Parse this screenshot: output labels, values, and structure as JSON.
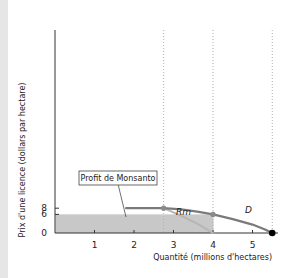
{
  "chart_data": {
    "type": "line",
    "title": "",
    "xlabel": "Quantité (millions d'hectares)",
    "ylabel": "Prix d'une licence (dollars par hectare)",
    "xlim": [
      0,
      5.6
    ],
    "ylim": [
      0,
      25
    ],
    "x_ticks": [
      1,
      2,
      3,
      4,
      5
    ],
    "x_tick_labels": [
      "1",
      "2",
      "3",
      "4",
      "5"
    ],
    "y_ticks": [
      0,
      6,
      8
    ],
    "y_tick_labels": [
      "0",
      "6",
      "8"
    ],
    "grid": false,
    "series": [
      {
        "name": "D",
        "label": "D",
        "color": "#7a7a7a",
        "points": [
          [
            1.8,
            8
          ],
          [
            2.75,
            8
          ],
          [
            3.2,
            7.6
          ],
          [
            3.6,
            6.9
          ],
          [
            4.0,
            6.0
          ],
          [
            4.5,
            4.5
          ],
          [
            5.0,
            2.7
          ],
          [
            5.3,
            1.2
          ],
          [
            5.5,
            0
          ]
        ]
      },
      {
        "name": "Rm",
        "label": "Rm",
        "color": "#b5b5b5",
        "points": [
          [
            2.75,
            8
          ],
          [
            3.2,
            5.5
          ],
          [
            3.6,
            3.0
          ],
          [
            4.0,
            0
          ]
        ]
      }
    ],
    "shaded_region": {
      "label": "Profit de Monsanto",
      "x": [
        0,
        4
      ],
      "y": [
        0,
        6
      ],
      "color": "#c8c8c8"
    },
    "reference_lines_x": [
      2.75,
      4,
      5.5
    ],
    "reference_line_y8": [
      1.8,
      2.75
    ],
    "markers": [
      {
        "x": 2.75,
        "y": 8,
        "color": "#8a8a8a"
      },
      {
        "x": 4,
        "y": 6,
        "color": "#8a8a8a"
      },
      {
        "x": 5.5,
        "y": 0,
        "color": "#000000"
      }
    ],
    "annotations": [
      {
        "text": "Profit de Monsanto",
        "points_to": [
          1.8,
          2
        ]
      }
    ]
  },
  "bottom_caption": "a ... i ... l ... d ... l ... l ... d ... l ..."
}
